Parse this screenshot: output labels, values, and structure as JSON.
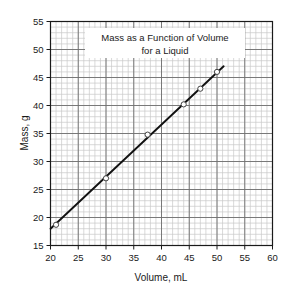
{
  "chart_data": {
    "type": "scatter",
    "title_line1": "Mass as a Function of Volume",
    "title_line2": "for a Liquid",
    "xlabel": "Volume, mL",
    "ylabel": "Mass, g",
    "xlim": [
      20,
      60
    ],
    "ylim": [
      15,
      55
    ],
    "xticks": [
      20,
      25,
      30,
      35,
      40,
      45,
      50,
      55,
      60
    ],
    "yticks": [
      15,
      20,
      25,
      30,
      35,
      40,
      45,
      50,
      55
    ],
    "x_major_step": 5,
    "y_major_step": 5,
    "minor_per_major": 5,
    "grid": true,
    "grid_minor": true,
    "legend": "none",
    "marker": "open-circle",
    "series": [
      {
        "name": "Liquid sample",
        "x": [
          21.0,
          30.0,
          37.5,
          44.0,
          47.0,
          50.0
        ],
        "y": [
          18.7,
          27.0,
          34.8,
          40.2,
          43.0,
          46.0
        ]
      }
    ],
    "fit_line": {
      "type": "best-fit",
      "x_start": 20.0,
      "y_start": 18.0,
      "x_end": 51.2,
      "y_end": 47.0,
      "slope": 0.93,
      "intercept": -0.6
    },
    "colors": {
      "line": "#111111",
      "marker_face": "#ffffff",
      "marker_edge": "#444444",
      "grid_major": "#6e6e6e",
      "grid_minor": "#c8c8c8",
      "axis": "#1a1a1a",
      "background": "#ffffff"
    }
  }
}
